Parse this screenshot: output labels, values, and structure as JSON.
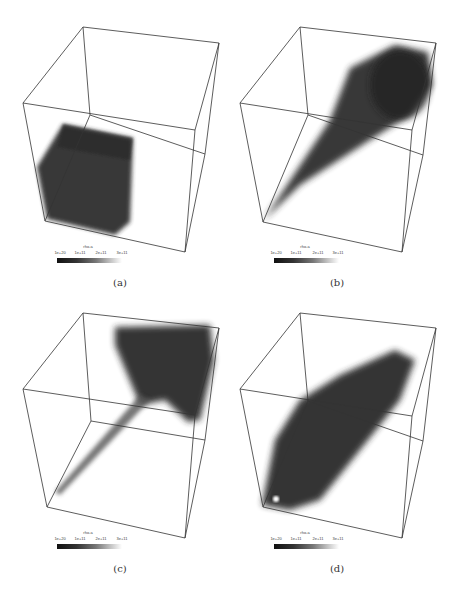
{
  "figure": {
    "panels": [
      {
        "caption": "(a)",
        "colorbar": {
          "title": "rho-a",
          "ticks": [
            "1e+20",
            "1e+11",
            "2e+11",
            "3e+11"
          ]
        }
      },
      {
        "caption": "(b)",
        "colorbar": {
          "title": "rho-a",
          "ticks": [
            "1e+20",
            "1e+11",
            "2e+11",
            "3e+11"
          ]
        }
      },
      {
        "caption": "(c)",
        "colorbar": {
          "title": "rho-a",
          "ticks": [
            "1e+20",
            "1e+11",
            "2e+11",
            "3e+11"
          ]
        }
      },
      {
        "caption": "(d)",
        "colorbar": {
          "title": "rho-a",
          "ticks": [
            "1e+20",
            "1e+11",
            "2e+11",
            "3e+11"
          ]
        }
      }
    ],
    "colors": {
      "density": "#2a2a2a",
      "box_lines": "#333333"
    }
  }
}
